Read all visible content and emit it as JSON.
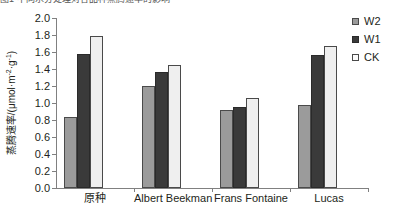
{
  "top_caption": "图1 不同水分处理对各品种蒸腾速率的影响",
  "legend": {
    "position": "right",
    "items": [
      {
        "name": "W2",
        "label": "W2",
        "color": "#9b9b9b",
        "swatch": "square-swatch"
      },
      {
        "name": "W1",
        "label": "W1",
        "color": "#3a3a3a",
        "swatch": "square-swatch"
      },
      {
        "name": "CK",
        "label": "CK",
        "color": "#fbfbfb",
        "swatch": "square-swatch"
      }
    ]
  },
  "axes": {
    "y_title_main": "蒸腾速率/(μmol·m",
    "y_title_sup1": "-2",
    "y_title_mid": "·g",
    "y_title_sup2": "-1",
    "y_title_end": ")",
    "y_ticks": [
      "0.0",
      "0.2",
      "0.4",
      "0.6",
      "0.8",
      "1.0",
      "1.2",
      "1.4",
      "1.6",
      "1.8",
      "2.0"
    ]
  },
  "chart_data": {
    "type": "bar",
    "title": "",
    "xlabel": "",
    "ylabel": "蒸腾速率/(μmol·m-2·g-1)",
    "ylim": [
      0.0,
      2.0
    ],
    "ytick_step": 0.2,
    "grid": false,
    "legend_position": "right",
    "categories": [
      "原种",
      "Albert Beekman",
      "Frans Fontaine",
      "Lucas"
    ],
    "series": [
      {
        "name": "W2",
        "color": "#9b9b9b",
        "values": [
          0.84,
          1.2,
          0.92,
          0.98
        ]
      },
      {
        "name": "W1",
        "color": "#3a3a3a",
        "values": [
          1.58,
          1.36,
          0.95,
          1.56
        ]
      },
      {
        "name": "CK",
        "color": "#efefef",
        "values": [
          1.79,
          1.45,
          1.06,
          1.67
        ]
      }
    ]
  }
}
